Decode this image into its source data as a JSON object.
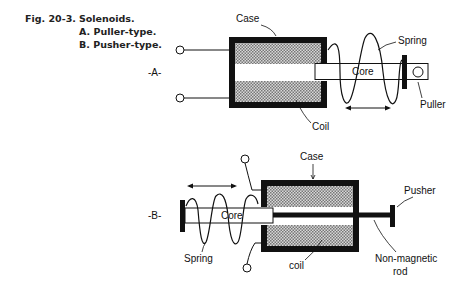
{
  "caption": {
    "figure_number": "Fig. 20-3.",
    "title": "Solenoids.",
    "items": [
      {
        "label": "A.",
        "text": "Puller-type."
      },
      {
        "label": "B.",
        "text": "Pusher-type."
      }
    ]
  },
  "diagram_a": {
    "tag": "-A-",
    "labels": {
      "case": "Case",
      "spring": "Spring",
      "core": "Core",
      "coil": "Coil",
      "puller": "Puller"
    }
  },
  "diagram_b": {
    "tag": "-B-",
    "labels": {
      "case": "Case",
      "pusher": "Pusher",
      "core": "Core",
      "spring": "Spring",
      "coil": "coil",
      "rod_line1": "Non-magnetic",
      "rod_line2": "rod"
    }
  }
}
